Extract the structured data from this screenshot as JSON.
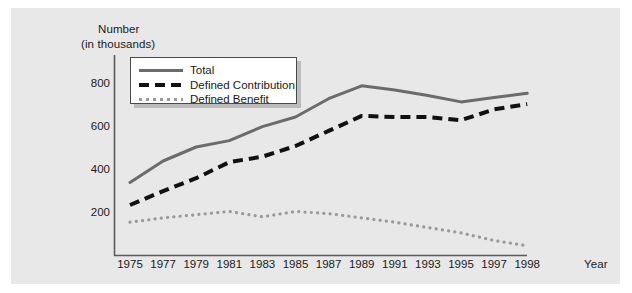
{
  "chart_data": {
    "type": "line",
    "title": "",
    "ylabel": "Number (in thousands)",
    "ylabel_lines": [
      "Number",
      "(in thousands)"
    ],
    "xlabel": "Year",
    "categories": [
      "1975",
      "1977",
      "1979",
      "1981",
      "1983",
      "1985",
      "1987",
      "1989",
      "1991",
      "1993",
      "1995",
      "1997",
      "1998"
    ],
    "xticklabels": [
      "1975",
      "1977",
      "1979",
      "1981",
      "1983",
      "1985",
      "1987",
      "1989",
      "1991",
      "1993",
      "1995",
      "1997",
      "1998"
    ],
    "yticklabels": [
      "200",
      "400",
      "600",
      "800"
    ],
    "yticks": [
      200,
      400,
      600,
      800
    ],
    "ylim": [
      0,
      900
    ],
    "grid": false,
    "legend_position": "upper-left-inside",
    "series": [
      {
        "name": "Total",
        "style": "solid",
        "color": "#6b6b6b",
        "values": [
          340,
          440,
          505,
          535,
          600,
          645,
          730,
          790,
          770,
          745,
          715,
          735,
          755
        ]
      },
      {
        "name": "Defined Contribution",
        "style": "dashed",
        "color": "#111111",
        "values": [
          235,
          300,
          360,
          435,
          460,
          510,
          580,
          650,
          645,
          645,
          630,
          680,
          705
        ]
      },
      {
        "name": "Defined Benefit",
        "style": "dotted",
        "color": "#9a9a9a",
        "values": [
          155,
          175,
          190,
          205,
          180,
          205,
          195,
          175,
          155,
          130,
          105,
          70,
          45
        ]
      }
    ]
  },
  "legend": {
    "items": [
      {
        "label": "Total"
      },
      {
        "label": "Defined Contribution"
      },
      {
        "label": "Defined Benefit"
      }
    ]
  },
  "colors": {
    "panel_background": "#e8e8e8",
    "figure_background": "#ffffff",
    "axis": "#5a5a5a",
    "text": "#1a1a1a",
    "total_line": "#6b6b6b",
    "defined_contribution_line": "#111111",
    "defined_benefit_line": "#9a9a9a",
    "legend_border": "#4a4a4a",
    "legend_shadow": "#bcbcbc"
  }
}
